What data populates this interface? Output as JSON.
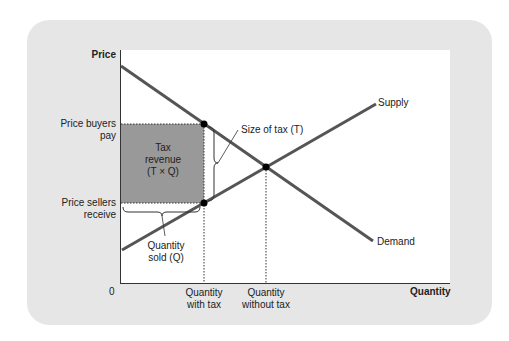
{
  "axes": {
    "y_label": "Price",
    "x_label": "Quantity",
    "origin": "0"
  },
  "price_labels": {
    "buyers_line1": "Price buyers",
    "buyers_line2": "pay",
    "sellers_line1": "Price sellers",
    "sellers_line2": "receive"
  },
  "quantity_labels": {
    "with_tax_line1": "Quantity",
    "with_tax_line2": "with tax",
    "without_tax_line1": "Quantity",
    "without_tax_line2": "without tax"
  },
  "curves": {
    "supply": "Supply",
    "demand": "Demand"
  },
  "annotations": {
    "tax_size": "Size of tax (T)",
    "tax_revenue_line1": "Tax",
    "tax_revenue_line2": "revenue",
    "tax_revenue_line3": "(T × Q)",
    "quantity_sold_line1": "Quantity",
    "quantity_sold_line2": "sold (Q)"
  },
  "colors": {
    "panel": "#e6e6e6",
    "curve": "#555555",
    "tax_area": "#999999"
  }
}
